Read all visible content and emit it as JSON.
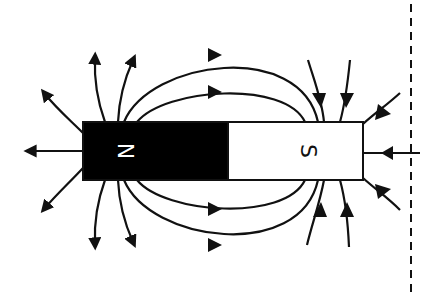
{
  "diagram": {
    "title": "",
    "magnet": {
      "north_label": "N",
      "south_label": "S",
      "north_color": "#000000",
      "south_color": "#ffffff",
      "outline_color": "#111111"
    },
    "field_lines": {
      "color": "#111111",
      "direction": "from N pole outward, into S pole"
    },
    "reference_line": {
      "style": "dashed",
      "orientation": "vertical",
      "color": "#111111"
    }
  }
}
